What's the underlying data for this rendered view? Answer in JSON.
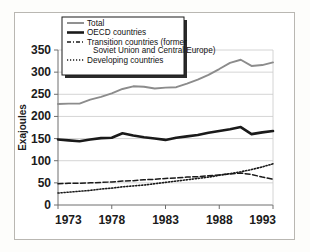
{
  "chart_data": {
    "type": "line",
    "title": "",
    "xlabel": "",
    "ylabel": "Exajoules",
    "xlim": [
      1973,
      1993
    ],
    "ylim": [
      0,
      350
    ],
    "xticks": [
      1973,
      1978,
      1983,
      1988,
      1993
    ],
    "yticks": [
      0,
      50,
      100,
      150,
      200,
      250,
      300,
      350
    ],
    "grid": "horizontal",
    "legend_position": "upper-left",
    "x": [
      1973,
      1974,
      1975,
      1976,
      1977,
      1978,
      1979,
      1980,
      1981,
      1982,
      1983,
      1984,
      1985,
      1986,
      1987,
      1988,
      1989,
      1990,
      1991,
      1992,
      1993
    ],
    "series": [
      {
        "name": "Total",
        "style": "solid",
        "color": "#8c8c8c",
        "width": 1.9,
        "values": [
          228,
          229,
          229,
          238,
          244,
          252,
          262,
          268,
          267,
          263,
          265,
          266,
          274,
          283,
          294,
          307,
          321,
          328,
          314,
          316,
          322
        ]
      },
      {
        "name": "OECD countries",
        "style": "solid",
        "color": "#1a1a1a",
        "width": 2.6,
        "values": [
          148,
          146,
          144,
          148,
          151,
          152,
          162,
          157,
          153,
          150,
          147,
          152,
          155,
          158,
          163,
          167,
          171,
          176,
          160,
          164,
          167
        ]
      },
      {
        "name": "Transition countries (former Soviet Union and Central Europe)",
        "style": "dashed",
        "color": "#1a1a1a",
        "width": 1.5,
        "values": [
          48,
          49,
          49,
          50,
          51,
          52,
          54,
          55,
          57,
          58,
          60,
          61,
          63,
          64,
          66,
          68,
          70,
          72,
          69,
          63,
          58
        ]
      },
      {
        "name": "Developing countries",
        "style": "dotted",
        "color": "#1a1a1a",
        "width": 1.6,
        "values": [
          27,
          29,
          31,
          33,
          36,
          38,
          41,
          43,
          45,
          48,
          51,
          54,
          57,
          60,
          63,
          67,
          71,
          75,
          80,
          86,
          93
        ]
      }
    ]
  },
  "legend": {
    "items": [
      {
        "label": "Total",
        "swatch": "solid-gray"
      },
      {
        "label": "OECD countries",
        "swatch": "solid-black-thick"
      },
      {
        "label": "Transition countries (former",
        "swatch": "dash-dot"
      },
      {
        "label": "Soviet Union and Central Europe)",
        "swatch": "none"
      },
      {
        "label": "Developing countries",
        "swatch": "dotted"
      }
    ]
  },
  "axes": {
    "y_title": "Exajoules",
    "y_tick_labels": [
      "350",
      "300",
      "250",
      "200",
      "150",
      "100",
      "50",
      "0"
    ],
    "x_tick_labels": [
      "1973",
      "1978",
      "1983",
      "1988",
      "1993"
    ]
  }
}
